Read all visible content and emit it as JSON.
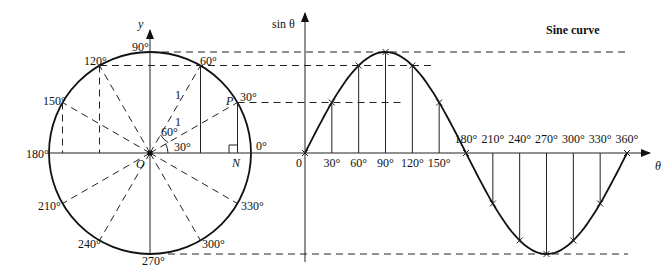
{
  "chart_data": {
    "type": "line",
    "title": "Sine curve",
    "xlabel": "θ",
    "ylabel": "sin θ",
    "x_unit": "degrees",
    "x": [
      0,
      30,
      60,
      90,
      120,
      150,
      180,
      210,
      240,
      270,
      300,
      330,
      360
    ],
    "tick_labels": [
      "0",
      "30°",
      "60°",
      "90°",
      "120°",
      "150°",
      "180°",
      "210°",
      "240°",
      "270°",
      "300°",
      "330°",
      "360°"
    ],
    "series": [
      {
        "name": "sin θ",
        "values": [
          0,
          0.5,
          0.866,
          1,
          0.866,
          0.5,
          0,
          -0.5,
          -0.866,
          -1,
          -0.866,
          -0.5,
          0
        ]
      }
    ],
    "ylim": [
      -1,
      1
    ],
    "grid": false
  },
  "unit_circle": {
    "y_axis_label": "y",
    "origin_label": "O",
    "point_label": "P",
    "foot_label": "N",
    "radius_label": "1",
    "angle_labels": [
      "0°",
      "30°",
      "60°",
      "90°",
      "120°",
      "150°",
      "180°",
      "210°",
      "240°",
      "270°",
      "300°",
      "330°"
    ],
    "inner_angle_labels": [
      "30°",
      "60°"
    ]
  },
  "sine_graph": {
    "title": "Sine curve",
    "y_axis_label": "sin θ",
    "x_axis_label": "θ",
    "origin_label": "0"
  }
}
